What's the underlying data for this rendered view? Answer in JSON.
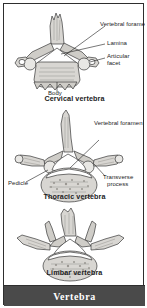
{
  "figure": {
    "footer_title": "Vertebra"
  },
  "panels": [
    {
      "id": "cervical",
      "caption": "Cervical vertebra",
      "labels": [
        {
          "name": "vertebral-foramen",
          "text": "Vertebral foramen"
        },
        {
          "name": "lamina",
          "text": "Lamina"
        },
        {
          "name": "articular-facet-line1",
          "text": "Articular"
        },
        {
          "name": "articular-facet-line2",
          "text": "facet"
        },
        {
          "name": "body",
          "text": "Body"
        }
      ]
    },
    {
      "id": "thoracic",
      "caption": "Thoracic vertebra",
      "labels": [
        {
          "name": "vertebral-foramen",
          "text": "Vertebral foramen"
        },
        {
          "name": "pedicle",
          "text": "Pedicle"
        },
        {
          "name": "transverse-process-line1",
          "text": "Transverse"
        },
        {
          "name": "transverse-process-line2",
          "text": "process"
        }
      ]
    },
    {
      "id": "lumbar",
      "caption": "Limbar vertebra",
      "labels": []
    }
  ],
  "colors": {
    "footer_background": "#4a4a4a",
    "footer_text": "#ffffff",
    "frame_border": "#2e2e2e",
    "bone_fill": "#d8d6d2",
    "line": "#1c1c1c",
    "page_background": "#ffffff"
  }
}
